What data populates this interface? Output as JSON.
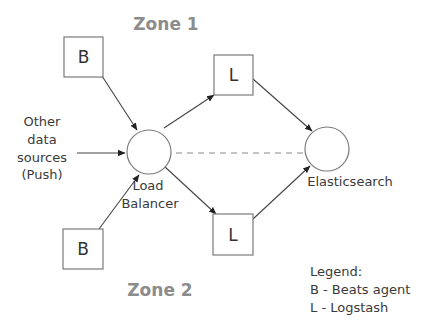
{
  "diagram": {
    "zones": {
      "zone1": "Zone 1",
      "zone2": "Zone 2"
    },
    "nodes": {
      "beats_top": {
        "label": "B",
        "shape": "box"
      },
      "beats_bottom": {
        "label": "B",
        "shape": "box"
      },
      "logstash_top": {
        "label": "L",
        "shape": "box"
      },
      "logstash_bottom": {
        "label": "L",
        "shape": "box"
      },
      "load_balancer": {
        "shape": "circle",
        "caption_line1": "Load",
        "caption_line2": "Balancer"
      },
      "elasticsearch": {
        "shape": "circle",
        "caption": "Elasticsearch"
      }
    },
    "other_sources": {
      "line1": "Other",
      "line2": "data",
      "line3": "sources",
      "line4": "(Push)"
    },
    "edges": [
      {
        "from": "beats_top",
        "to": "load_balancer",
        "style": "arrow"
      },
      {
        "from": "other_sources",
        "to": "load_balancer",
        "style": "arrow"
      },
      {
        "from": "beats_bottom",
        "to": "load_balancer",
        "style": "arrow"
      },
      {
        "from": "load_balancer",
        "to": "logstash_top",
        "style": "arrow"
      },
      {
        "from": "load_balancer",
        "to": "logstash_bottom",
        "style": "arrow"
      },
      {
        "from": "logstash_top",
        "to": "elasticsearch",
        "style": "arrow"
      },
      {
        "from": "logstash_bottom",
        "to": "elasticsearch",
        "style": "arrow"
      },
      {
        "from": "load_balancer",
        "to": "elasticsearch",
        "style": "dashed"
      }
    ],
    "legend": {
      "title": "Legend:",
      "items": [
        "B - Beats agent",
        "L - Logstash"
      ]
    }
  }
}
